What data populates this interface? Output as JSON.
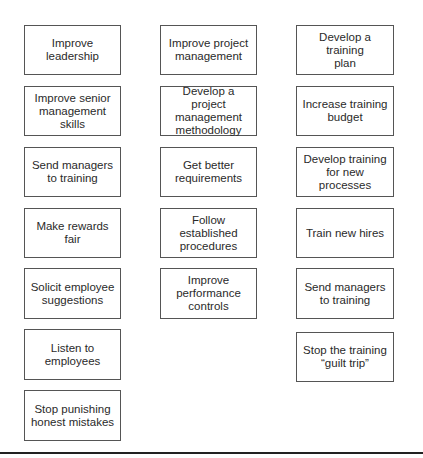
{
  "columns": [
    {
      "items": [
        {
          "label": "Improve\nleadership"
        },
        {
          "label": "Improve senior\nmanagement skills"
        },
        {
          "label": "Send managers\nto training"
        },
        {
          "label": "Make rewards fair"
        },
        {
          "label": "Solicit employee\nsuggestions"
        },
        {
          "label": "Listen to\nemployees"
        },
        {
          "label": "Stop punishing\nhonest mistakes"
        }
      ]
    },
    {
      "items": [
        {
          "label": "Improve project\nmanagement"
        },
        {
          "label": "Develop a project\nmanagement\nmethodology"
        },
        {
          "label": "Get better\nrequirements"
        },
        {
          "label": "Follow established\nprocedures"
        },
        {
          "label": "Improve\nperformance\ncontrols"
        }
      ]
    },
    {
      "items": [
        {
          "label": "Develop a training\nplan"
        },
        {
          "label": "Increase training\nbudget"
        },
        {
          "label": "Develop training\nfor new\nprocesses"
        },
        {
          "label": "Train new hires"
        },
        {
          "label": "Send managers\nto training"
        },
        {
          "label": "Stop the training\n“guilt trip”"
        }
      ]
    }
  ]
}
